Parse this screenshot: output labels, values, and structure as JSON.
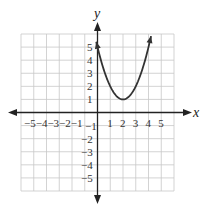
{
  "chart_data": {
    "type": "line",
    "title": "",
    "xlabel": "x",
    "ylabel": "y",
    "xlim": [
      -6,
      6
    ],
    "ylim": [
      -6,
      6
    ],
    "grid": true,
    "x_ticks": [
      "-5",
      "-4",
      "-3",
      "-2",
      "-1",
      "1",
      "2",
      "3",
      "4",
      "5"
    ],
    "y_ticks": [
      "5",
      "4",
      "3",
      "2",
      "1",
      "-1",
      "-2",
      "-3",
      "-4",
      "-5"
    ],
    "series": [
      {
        "name": "parabola",
        "equation": "y = (x - 2)^2 + 1",
        "vertex": [
          2,
          1
        ],
        "x": [
          -0.1,
          0,
          0.5,
          1,
          1.5,
          2,
          2.5,
          3,
          3.5,
          4,
          4.2
        ],
        "y": [
          5.41,
          5,
          3.25,
          2,
          1.25,
          1,
          1.25,
          2,
          3.25,
          5,
          5.84
        ],
        "arrows_at_ends": true
      }
    ],
    "colors": {
      "curve": "#333333",
      "axis": "#222222",
      "grid": "#c8c8c8"
    }
  },
  "labels": {
    "x_axis": "x",
    "y_axis": "y",
    "x_neg": "−5−4−3−2−1",
    "x_pos": [
      "1",
      "2",
      "3",
      "4",
      "5"
    ],
    "y_pos": [
      "5",
      "4",
      "3",
      "2",
      "1"
    ],
    "y_neg": [
      "−1",
      "−2",
      "−3",
      "−4",
      "−5"
    ]
  }
}
